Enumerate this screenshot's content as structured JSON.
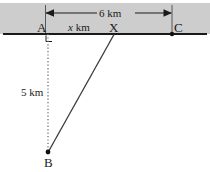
{
  "figure": {
    "type": "geometry-diagram",
    "background_color": "#ffffff",
    "band_color": "#cdcdcd",
    "line_color": "#1a1a1a"
  },
  "labels": {
    "point_a": "A",
    "point_b": "B",
    "point_c": "C",
    "point_x": "X",
    "dim_top": "6 km",
    "dim_ax": "x km",
    "dim_ax_var": "x",
    "dim_ax_unit": " km",
    "dim_ab": "5 km"
  },
  "geometry": {
    "road_line": {
      "x1": 3,
      "y1": 34,
      "x2": 207,
      "y2": 34
    },
    "band": {
      "x": 0,
      "y": 3,
      "width": 210,
      "height": 31
    },
    "dimension_6km": {
      "x1": 45,
      "x2": 172,
      "y": 13
    },
    "point_a": {
      "x": 48,
      "y": 34
    },
    "point_x": {
      "x": 114,
      "y": 34
    },
    "point_c": {
      "x": 172,
      "y": 34
    },
    "point_b": {
      "x": 48,
      "y": 152
    },
    "right_angle_marker": {
      "x": 46,
      "y": 35,
      "size": 6
    },
    "dotted_ab": {
      "x1": 48,
      "y1": 34,
      "x2": 48,
      "y2": 152
    },
    "solid_xb": {
      "x1": 114,
      "y1": 34,
      "x2": 48,
      "y2": 152
    }
  }
}
